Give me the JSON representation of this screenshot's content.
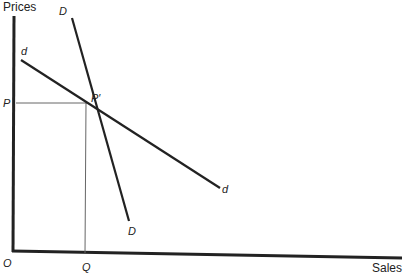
{
  "diagram": {
    "axes": {
      "y_label": "Prices",
      "x_label": "Sales",
      "origin_label": "O"
    },
    "curves": [
      {
        "name": "D",
        "label_top": "D",
        "label_bottom": "D",
        "description": "steep demand curve"
      },
      {
        "name": "d",
        "label_top": "d",
        "label_bottom": "d",
        "description": "flatter demand curve"
      }
    ],
    "points": {
      "price_label": "P",
      "quantity_label": "Q",
      "intersection_label": "P′"
    }
  }
}
